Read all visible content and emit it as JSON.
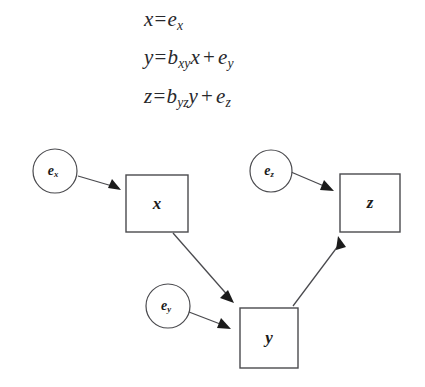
{
  "figure": {
    "background_color": "#ffffff",
    "stroke_color": "#4a4a4e",
    "text_color": "#1b1b1b"
  },
  "equations": [
    {
      "id": "eq-x",
      "lhs": "x",
      "operator": "=",
      "terms": [
        {
          "base": "e",
          "sub": "x"
        }
      ],
      "plain_text": "x = e_x"
    },
    {
      "id": "eq-y",
      "lhs": "y",
      "operator": "=",
      "terms": [
        {
          "base": "b",
          "sub": "xy",
          "multiplier": "x"
        },
        {
          "base": "e",
          "sub": "y"
        }
      ],
      "plus": "+",
      "plain_text": "y = b_xy x + e_y"
    },
    {
      "id": "eq-z",
      "lhs": "z",
      "operator": "=",
      "terms": [
        {
          "base": "b",
          "sub": "yz",
          "multiplier": "y"
        },
        {
          "base": "e",
          "sub": "z"
        }
      ],
      "plus": "+",
      "plain_text": "z = b_yz y + e_z"
    }
  ],
  "diagram": {
    "type": "path-diagram",
    "observed_variables": [
      {
        "id": "x",
        "label": "x",
        "shape": "rectangle",
        "x": 126,
        "y": 47,
        "width": 62,
        "height": 57
      },
      {
        "id": "z",
        "label": "z",
        "shape": "rectangle",
        "x": 340,
        "y": 46,
        "width": 60,
        "height": 58
      },
      {
        "id": "y",
        "label": "y",
        "shape": "rectangle",
        "x": 240,
        "y": 180,
        "width": 58,
        "height": 60
      }
    ],
    "error_terms": [
      {
        "id": "e_x",
        "base": "e",
        "sub": "x",
        "shape": "circle",
        "cx": 55,
        "cy": 43,
        "r": 22
      },
      {
        "id": "e_z",
        "base": "e",
        "sub": "z",
        "shape": "circle",
        "cx": 271,
        "cy": 43,
        "r": 21
      },
      {
        "id": "e_y",
        "base": "e",
        "sub": "y",
        "shape": "circle",
        "cx": 168,
        "cy": 178,
        "r": 22
      }
    ],
    "edges": [
      {
        "id": "ex-to-x",
        "from": "e_x",
        "to": "x",
        "style": "directed"
      },
      {
        "id": "ez-to-z",
        "from": "e_z",
        "to": "z",
        "style": "directed"
      },
      {
        "id": "ey-to-y",
        "from": "e_y",
        "to": "y",
        "style": "directed"
      },
      {
        "id": "x-to-y",
        "from": "x",
        "to": "y",
        "style": "directed"
      },
      {
        "id": "y-to-z",
        "from": "y",
        "to": "z",
        "style": "directed"
      }
    ]
  }
}
